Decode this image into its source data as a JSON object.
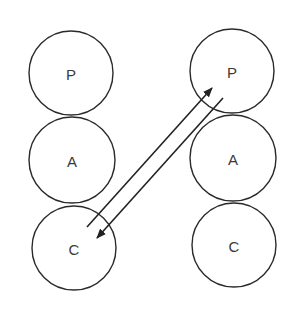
{
  "diagram": {
    "type": "node-diagram",
    "columns": [
      {
        "id": "left",
        "nodes": [
          {
            "label": "P",
            "cx": 71,
            "cy": 73,
            "r": 42
          },
          {
            "label": "A",
            "cx": 72,
            "cy": 160,
            "r": 43
          },
          {
            "label": "C",
            "cx": 74,
            "cy": 248,
            "r": 42
          }
        ]
      },
      {
        "id": "right",
        "nodes": [
          {
            "label": "P",
            "cx": 232,
            "cy": 71,
            "r": 42
          },
          {
            "label": "A",
            "cx": 233,
            "cy": 158,
            "r": 43
          },
          {
            "label": "C",
            "cx": 234,
            "cy": 245,
            "r": 42
          }
        ]
      }
    ],
    "arrows": [
      {
        "from": "left.C",
        "to": "right.P",
        "x1": 87,
        "y1": 227,
        "x2": 212,
        "y2": 88
      },
      {
        "from": "right.P",
        "to": "left.C",
        "x1": 223,
        "y1": 98,
        "x2": 97,
        "y2": 238
      }
    ],
    "colors": {
      "stroke": "#2a2a2a",
      "text": "#3a3a3a",
      "background": "#ffffff"
    }
  }
}
